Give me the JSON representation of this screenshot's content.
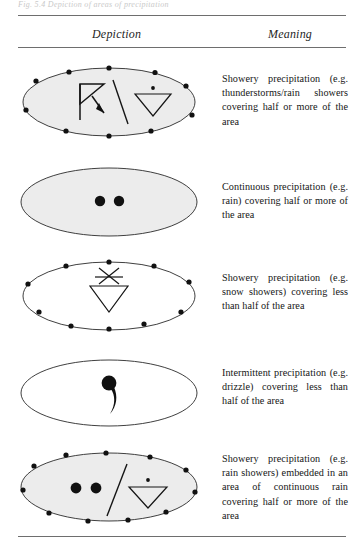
{
  "page": {
    "top_caption_fragment": "Fig. 5.4  Depiction of areas of precipitation",
    "rules": [
      "top",
      "under-head",
      "bottom"
    ]
  },
  "table": {
    "columns": [
      {
        "id": "depiction",
        "label": "Depiction"
      },
      {
        "id": "meaning",
        "label": "Meaning"
      }
    ],
    "rows": [
      {
        "id": "row-1",
        "depiction": {
          "ellipse_style": "shaded-dotted-boundary",
          "symbols": [
            "thunderstorm",
            "slash",
            "rain-shower"
          ],
          "boundary_dots": 10
        },
        "meaning": "Showery precipitation (e.g. thunderstorms/rain showers covering half or more of the area"
      },
      {
        "id": "row-2",
        "depiction": {
          "ellipse_style": "shaded-solid-boundary",
          "symbols": [
            "rain-dot",
            "rain-dot"
          ],
          "boundary_dots": 0
        },
        "meaning": "Continuous precipitation (e.g. rain) covering half or more of the area"
      },
      {
        "id": "row-3",
        "depiction": {
          "ellipse_style": "plain-dotted-boundary",
          "symbols": [
            "snow-shower"
          ],
          "boundary_dots": 10
        },
        "meaning": "Showery precipitation (e.g. snow showers) covering less than half of the area"
      },
      {
        "id": "row-4",
        "depiction": {
          "ellipse_style": "plain-solid-boundary",
          "symbols": [
            "drizzle-comma"
          ],
          "boundary_dots": 0
        },
        "meaning": "Intermittent precipitation (e.g. drizzle) covering less than half of the area"
      },
      {
        "id": "row-5",
        "depiction": {
          "ellipse_style": "shaded-dotted-boundary",
          "symbols": [
            "rain-dot",
            "rain-dot",
            "slash",
            "rain-shower"
          ],
          "boundary_dots": 11
        },
        "meaning": "Showery precipitation (e.g. rain showers) embedded in an area of continuous rain covering half or more of the area"
      }
    ]
  },
  "colors": {
    "rule": "#6e6e6e",
    "ink": "#151515",
    "shading": "#ececec"
  }
}
